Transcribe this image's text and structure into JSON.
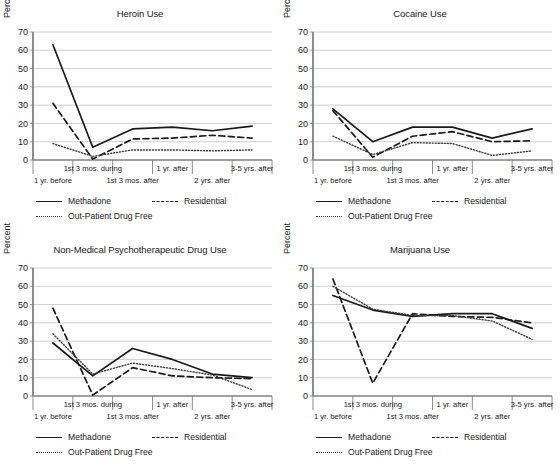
{
  "figure": {
    "panel_count": 4,
    "ylabel": "Percent",
    "yticks": [
      0,
      10,
      20,
      30,
      40,
      50,
      60,
      70
    ],
    "categories": [
      "1 yr. before",
      "1st 3 mos. during",
      "1st 3 mos. after",
      "1 yr. after",
      "2 yrs. after",
      "3-5 yrs. after"
    ],
    "legend": [
      {
        "label": "Methadone",
        "style": "solid",
        "swatch": "solid-line-swatch"
      },
      {
        "label": "Residential",
        "style": "dashed",
        "swatch": "dashed-line-swatch"
      },
      {
        "label": "Out-Patient Drug Free",
        "style": "dotted",
        "swatch": "dotted-line-swatch"
      }
    ],
    "colors": {
      "line": "#1a1a1a",
      "dotted_line": "#3a3a3a",
      "grid": "#c9c9c9",
      "axis": "#808080",
      "background": "#ffffff"
    }
  },
  "chart_data": [
    {
      "type": "line",
      "title": "Heroin Use",
      "xlabel": "",
      "ylabel": "Percent",
      "ylim": [
        0,
        70
      ],
      "grid": true,
      "legend_position": "bottom",
      "categories": [
        "1 yr. before",
        "1st 3 mos. during",
        "1st 3 mos. after",
        "1 yr. after",
        "2 yrs. after",
        "3-5 yrs. after"
      ],
      "series": [
        {
          "name": "Methadone",
          "style": "solid",
          "values": [
            63,
            7,
            17,
            18,
            16,
            18.5
          ]
        },
        {
          "name": "Residential",
          "style": "dashed",
          "values": [
            31,
            0.5,
            11.5,
            12,
            13.5,
            12
          ]
        },
        {
          "name": "Out-Patient Drug Free",
          "style": "dotted",
          "values": [
            9,
            2,
            5.5,
            5.5,
            5,
            5.5
          ]
        }
      ]
    },
    {
      "type": "line",
      "title": "Cocaine Use",
      "xlabel": "",
      "ylabel": "Percent",
      "ylim": [
        0,
        70
      ],
      "grid": true,
      "legend_position": "bottom",
      "categories": [
        "1 yr. before",
        "1st 3 mos. during",
        "1st 3 mos. after",
        "1 yr. after",
        "2 yrs. after",
        "3-5 yrs. after"
      ],
      "series": [
        {
          "name": "Methadone",
          "style": "solid",
          "values": [
            28,
            10,
            18,
            18,
            12,
            17
          ]
        },
        {
          "name": "Residential",
          "style": "dashed",
          "values": [
            27,
            1.5,
            13,
            15.5,
            10,
            10.5
          ]
        },
        {
          "name": "Out-Patient Drug Free",
          "style": "dotted",
          "values": [
            13,
            3,
            9.5,
            9,
            2.5,
            5
          ]
        }
      ]
    },
    {
      "type": "line",
      "title": "Non-Medical Psychotherapeutic Drug Use",
      "xlabel": "",
      "ylabel": "Percent",
      "ylim": [
        0,
        70
      ],
      "grid": true,
      "legend_position": "bottom",
      "categories": [
        "1 yr. before",
        "1st 3 mos. during",
        "1st 3 mos. after",
        "1 yr. after",
        "2 yrs. after",
        "3-5 yrs. after"
      ],
      "series": [
        {
          "name": "Methadone",
          "style": "solid",
          "values": [
            29,
            11,
            26,
            20,
            12,
            10
          ]
        },
        {
          "name": "Residential",
          "style": "dashed",
          "values": [
            48,
            0.5,
            15.5,
            11,
            10,
            9.5
          ]
        },
        {
          "name": "Out-Patient Drug Free",
          "style": "dotted",
          "values": [
            34,
            12,
            18,
            15,
            11.5,
            3.5
          ]
        }
      ]
    },
    {
      "type": "line",
      "title": "Marijuana Use",
      "xlabel": "",
      "ylabel": "Percent",
      "ylim": [
        0,
        70
      ],
      "grid": true,
      "legend_position": "bottom",
      "categories": [
        "1 yr. before",
        "1st 3 mos. during",
        "1st 3 mos. after",
        "1 yr. after",
        "2 yrs. after",
        "3-5 yrs. after"
      ],
      "series": [
        {
          "name": "Methadone",
          "style": "solid",
          "values": [
            55,
            47,
            43.5,
            45,
            45,
            37
          ]
        },
        {
          "name": "Residential",
          "style": "dashed",
          "values": [
            64,
            7,
            45,
            43.5,
            43,
            40
          ]
        },
        {
          "name": "Out-Patient Drug Free",
          "style": "dotted",
          "values": [
            60,
            47.5,
            44,
            44,
            41,
            31
          ]
        }
      ]
    }
  ]
}
